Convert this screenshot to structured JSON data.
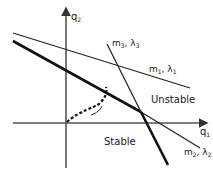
{
  "diagram": {
    "axes": {
      "horizontal": {
        "label": "q",
        "subscript": "1"
      },
      "vertical": {
        "label": "q",
        "subscript": "2"
      }
    },
    "lines": [
      {
        "id": "line-1",
        "label": "m",
        "label_sub": "1",
        "param": "λ",
        "param_sub": "1",
        "weight": "thin"
      },
      {
        "id": "line-2",
        "label": "m",
        "label_sub": "2",
        "param": "λ",
        "param_sub": "2",
        "weight": "thick-then-thin"
      },
      {
        "id": "line-3",
        "label": "m",
        "label_sub": "3",
        "param": "λ",
        "param_sub": "3",
        "weight": "thin-then-thick"
      }
    ],
    "regions": {
      "unstable": "Unstable",
      "stable": "Stable"
    },
    "path": {
      "style": "dashed",
      "description": "trajectory from origin to stability boundary"
    },
    "comma": ", "
  }
}
